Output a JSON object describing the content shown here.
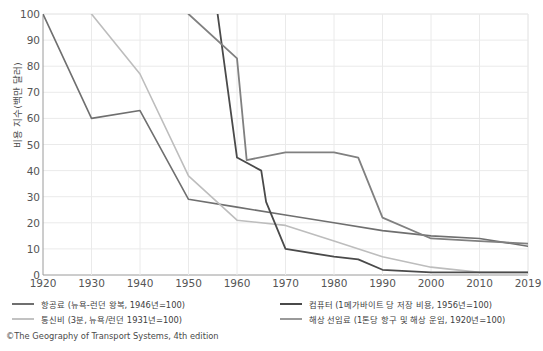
{
  "chart_data": {
    "type": "line",
    "title": "",
    "xlabel": "",
    "ylabel": "비용 지수(백만 달러)",
    "xlim": [
      1920,
      2019
    ],
    "ylim": [
      0,
      100
    ],
    "grid": true,
    "legend_position": "bottom",
    "x_ticks": [
      "1920",
      "1930",
      "1940",
      "1950",
      "1960",
      "1970",
      "1980",
      "1990",
      "2000",
      "2010",
      "2019"
    ],
    "y_ticks": [
      "0",
      "10",
      "20",
      "30",
      "40",
      "50",
      "60",
      "70",
      "80",
      "90",
      "100"
    ],
    "series": [
      {
        "name": "항공료 (뉴욕-런던 왕복, 1946년=100)",
        "color": "#6f6f6f",
        "width": 1.6,
        "x": [
          1920,
          1930,
          1940,
          1950,
          1960,
          1970,
          1980,
          1990,
          2000,
          2010,
          2019
        ],
        "values": [
          100,
          60,
          63,
          29,
          26,
          23,
          20,
          17,
          15,
          14,
          11
        ]
      },
      {
        "name": "통신비 (3분, 뉴욕/런던 1931년=100)",
        "color": "#bdbdbd",
        "width": 1.6,
        "x": [
          1930,
          1940,
          1950,
          1960,
          1970,
          1980,
          1990,
          2000,
          2010,
          2019
        ],
        "values": [
          100,
          77,
          38,
          21,
          19,
          13,
          7,
          3,
          1,
          1
        ]
      },
      {
        "name": "컴퓨터 (1메가바이트 당 저장 비용, 1956년=100)",
        "color": "#4a4a4a",
        "width": 1.8,
        "x": [
          1956,
          1960,
          1965,
          1966,
          1970,
          1980,
          1985,
          1990,
          2000,
          2010,
          2019
        ],
        "values": [
          100,
          45,
          40,
          28,
          10,
          7,
          6,
          2,
          1,
          1,
          1
        ]
      },
      {
        "name": "해상 선임료 (1톤당 항구 및 해상 운임, 1920년=100)",
        "color": "#808080",
        "width": 1.8,
        "x": [
          1950,
          1960,
          1962,
          1970,
          1980,
          1985,
          1990,
          2000,
          2010,
          2019
        ],
        "values": [
          100,
          83,
          44,
          47,
          47,
          45,
          22,
          14,
          13,
          12
        ]
      }
    ]
  },
  "legend": {
    "items": [
      {
        "label": "항공료 (뉴욕-런던 왕복, 1946년=100)",
        "color": "#6f6f6f"
      },
      {
        "label": "컴퓨터 (1메가바이트 당 저장 비용, 1956년=100)",
        "color": "#4a4a4a"
      },
      {
        "label": "통신비 (3분, 뉴욕/런던 1931년=100)",
        "color": "#c2c2c2"
      },
      {
        "label": "해상 선임료 (1톤당 항구 및 해상 운임, 1920년=100)",
        "color": "#9a9a9a"
      }
    ]
  },
  "credit": "©The Geography of Transport Systems, 4th edition",
  "axes": {
    "y_label": "비용 지수(백만 달러)"
  }
}
